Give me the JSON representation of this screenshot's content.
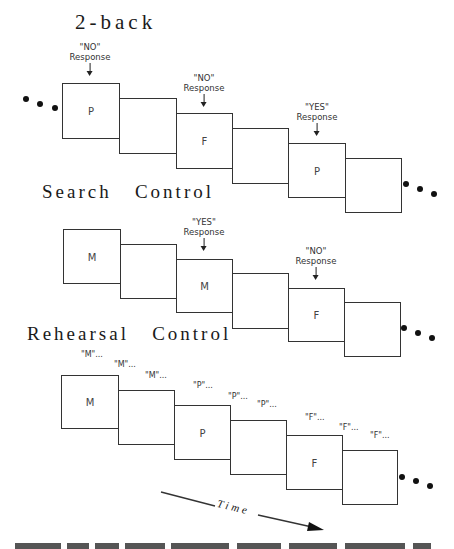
{
  "sections": {
    "two_back": {
      "title": "2-back",
      "boxes": [
        {
          "letter": "P"
        },
        {
          "letter": ""
        },
        {
          "letter": "F"
        },
        {
          "letter": ""
        },
        {
          "letter": "P"
        },
        {
          "letter": ""
        }
      ],
      "responses": [
        {
          "quote": "\"NO\"",
          "label": "Response",
          "box_index": 0
        },
        {
          "quote": "\"NO\"",
          "label": "Response",
          "box_index": 2
        },
        {
          "quote": "\"YES\"",
          "label": "Response",
          "box_index": 4
        }
      ],
      "leading_ellipsis": true,
      "trailing_ellipsis": true
    },
    "search_control": {
      "title": "Search   Control",
      "boxes": [
        {
          "letter": "M"
        },
        {
          "letter": ""
        },
        {
          "letter": "M"
        },
        {
          "letter": ""
        },
        {
          "letter": "F"
        },
        {
          "letter": ""
        }
      ],
      "responses": [
        {
          "quote": "\"YES\"",
          "label": "Response",
          "box_index": 2
        },
        {
          "quote": "\"NO\"",
          "label": "Response",
          "box_index": 4
        }
      ],
      "trailing_ellipsis": true
    },
    "rehearsal_control": {
      "title": "Rehearsal   Control",
      "boxes": [
        {
          "letter": "M"
        },
        {
          "letter": ""
        },
        {
          "letter": "P"
        },
        {
          "letter": ""
        },
        {
          "letter": "F"
        },
        {
          "letter": ""
        }
      ],
      "rehearsal_labels": [
        "\"M\"...",
        "\"M\"...",
        "\"M\"...",
        "\"P\"...",
        "\"P\"...",
        "\"P\"...",
        "\"F\"...",
        "\"F\"...",
        "\"F\"..."
      ],
      "trailing_ellipsis": true
    }
  },
  "time_axis": {
    "label": "Time"
  },
  "colors": {
    "stroke": "#333333",
    "background": "#ffffff",
    "dot": "#111111"
  }
}
